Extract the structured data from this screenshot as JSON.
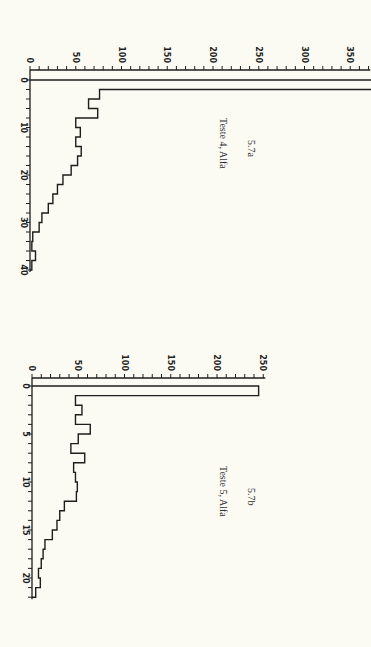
{
  "chart_data": [
    {
      "type": "bar",
      "orientation": "horizontal-histogram (rotated 90°)",
      "figure_number": "5.7a",
      "title": "Teste 4, Alfa",
      "xlabel": "",
      "ylabel": "",
      "value_axis": {
        "range": [
          0,
          350
        ],
        "tick_labels": [
          "0",
          "50",
          "100",
          "150",
          "200",
          "250",
          "300",
          "350"
        ],
        "minor_tick_step": 10
      },
      "bin_axis": {
        "range": [
          0,
          40
        ],
        "tick_labels": [
          "0",
          "10",
          "20",
          "30",
          "40"
        ],
        "bin_width": 2
      },
      "categories": [
        "0-2",
        "2-4",
        "4-6",
        "6-8",
        "8-10",
        "10-12",
        "12-14",
        "14-16",
        "16-18",
        "18-20",
        "20-22",
        "22-24",
        "24-26",
        "26-28",
        "28-30",
        "30-32",
        "32-34",
        "34-36",
        "36-38",
        "38-40"
      ],
      "values": [
        400,
        76,
        64,
        74,
        50,
        55,
        50,
        56,
        52,
        45,
        36,
        30,
        25,
        20,
        13,
        10,
        3,
        2,
        6,
        2
      ],
      "notes": "First bin extends beyond the right edge of the axis (>350)."
    },
    {
      "type": "bar",
      "orientation": "horizontal-histogram (rotated 90°)",
      "figure_number": "5.7b",
      "title": "Teste 5, Alfa",
      "xlabel": "",
      "ylabel": "",
      "value_axis": {
        "range": [
          0,
          250
        ],
        "tick_labels": [
          "0",
          "50",
          "100",
          "150",
          "200",
          "250"
        ],
        "minor_tick_step": 10
      },
      "bin_axis": {
        "range": [
          0,
          22
        ],
        "tick_labels": [
          "0",
          "5",
          "10",
          "15",
          "20"
        ],
        "bin_width": 1
      },
      "categories": [
        "0",
        "1",
        "2",
        "3",
        "4",
        "5",
        "6",
        "7",
        "8",
        "9",
        "10",
        "11",
        "12",
        "13",
        "14",
        "15",
        "16",
        "17",
        "18",
        "19",
        "20",
        "21"
      ],
      "values": [
        245,
        47,
        54,
        47,
        63,
        50,
        42,
        57,
        45,
        47,
        49,
        48,
        35,
        30,
        27,
        22,
        14,
        12,
        10,
        7,
        9,
        4
      ]
    }
  ],
  "captions": {
    "top_number": "5.7a",
    "top_title": "Teste 4, Alfa",
    "bottom_number": "5.7b",
    "bottom_title": "Teste 5, Alfa"
  }
}
